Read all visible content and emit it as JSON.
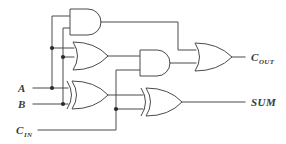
{
  "diagram": {
    "line_color": "#4a4a4a",
    "junction_color": "#2b2b2b",
    "background": "#ffffff"
  },
  "inputs": [
    {
      "id": "a",
      "label": "A",
      "subscript": "",
      "x": 22,
      "y": 88
    },
    {
      "id": "b",
      "label": "B",
      "subscript": "",
      "x": 22,
      "y": 104
    },
    {
      "id": "cin",
      "label": "C",
      "subscript": "IN",
      "x": 16,
      "y": 134
    }
  ],
  "outputs": [
    {
      "id": "cout",
      "label": "C",
      "subscript": "OUT",
      "x": 251,
      "y": 61
    },
    {
      "id": "sum",
      "label": "SUM",
      "subscript": "",
      "x": 251,
      "y": 109
    }
  ],
  "gates": [
    {
      "id": "and-top",
      "type": "AND",
      "label": "AND"
    },
    {
      "id": "or-mid",
      "type": "OR",
      "label": "OR"
    },
    {
      "id": "xor-first",
      "type": "XOR",
      "label": "XOR"
    },
    {
      "id": "and-mid",
      "type": "AND",
      "label": "AND"
    },
    {
      "id": "xor-second",
      "type": "XOR",
      "label": "XOR"
    },
    {
      "id": "or-out",
      "type": "OR",
      "label": "OR"
    }
  ],
  "junctions": [
    {
      "id": "a-branch-or",
      "x": 52,
      "y": 48
    },
    {
      "id": "b-branch-or",
      "x": 63,
      "y": 57
    },
    {
      "id": "a-branch-xor",
      "x": 52,
      "y": 88
    },
    {
      "id": "b-branch-xor",
      "x": 63,
      "y": 104
    },
    {
      "id": "cin-branch",
      "x": 116,
      "y": 109
    }
  ]
}
